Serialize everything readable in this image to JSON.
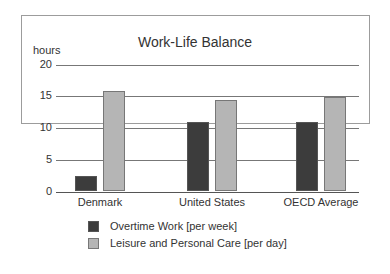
{
  "chart_data": {
    "type": "bar",
    "title": "Work-Life Balance",
    "xlabel": "",
    "ylabel": "hours",
    "ylim": [
      0,
      20
    ],
    "yticks": [
      "0",
      "5",
      "10",
      "15",
      "20"
    ],
    "grid": true,
    "legend_position": "bottom",
    "categories": [
      "Denmark",
      "United States",
      "OECD Average"
    ],
    "series": [
      {
        "name": "Overtime Work [per week]",
        "color": "#3c3c3c",
        "values": [
          2.4,
          11.0,
          11.0
        ]
      },
      {
        "name": "Leisure and Personal Care [per day]",
        "color": "#b5b5b5",
        "values": [
          15.8,
          14.4,
          14.9
        ]
      }
    ]
  }
}
